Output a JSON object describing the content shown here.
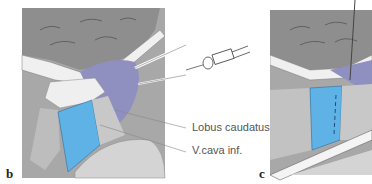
{
  "figure": {
    "panels": [
      {
        "letter": "b"
      },
      {
        "letter": "c"
      }
    ],
    "labels": [
      {
        "text": "Lobus caudatus"
      },
      {
        "text": "V.cava inf."
      }
    ],
    "colors": {
      "liver_gray": "#9c9c9c",
      "liver_dark": "#7a7a7a",
      "caudate_purple": "#8f8fc0",
      "vena_cava_blue": "#5fb2e6",
      "ligament_white": "#f2f2f2",
      "stipple": "#b8b8b8",
      "background": "#ffffff"
    }
  }
}
